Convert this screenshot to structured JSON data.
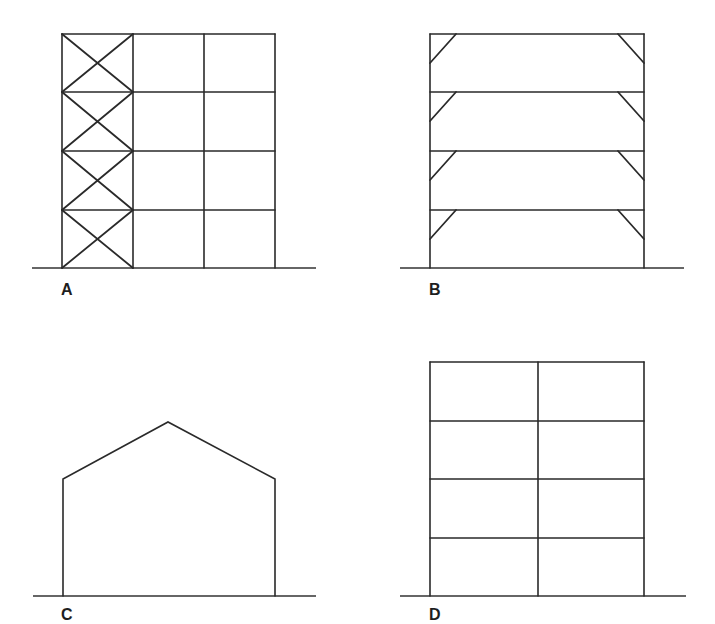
{
  "figure": {
    "panels": [
      {
        "id": "A",
        "label": "A",
        "description": "Braced frame: 4-storey, 3-bay frame with X-bracing in leftmost bay"
      },
      {
        "id": "B",
        "label": "B",
        "description": "Knee-braced frame: 4-storey single-bay frame with knee braces at each beam-column joint"
      },
      {
        "id": "C",
        "label": "C",
        "description": "Portal frame with pitched (gable) roof"
      },
      {
        "id": "D",
        "label": "D",
        "description": "Rigid (moment-resisting) frame: 4-storey, 2-bay"
      }
    ]
  },
  "colors": {
    "stroke": "#2a2a2a",
    "background": "#ffffff"
  }
}
